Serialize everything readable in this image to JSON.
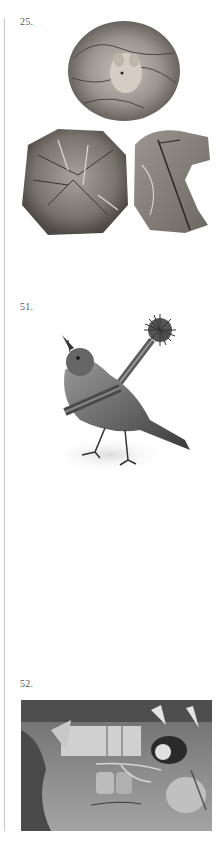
{
  "plates": [
    {
      "number": "25.",
      "subject": "mouse in leaf nest ball, two opened leaf balls below"
    },
    {
      "number": "51.",
      "subject": "bird with brush tied across its body"
    },
    {
      "number": "52.",
      "subject": "interior scene with mouse figures and tied animals"
    }
  ],
  "colors": {
    "rule": "#c8c8c8",
    "text": "#555555",
    "engraving_dark": "#3a3a3a",
    "engraving_mid": "#8a8a8a",
    "engraving_light": "#d8d8d8"
  }
}
